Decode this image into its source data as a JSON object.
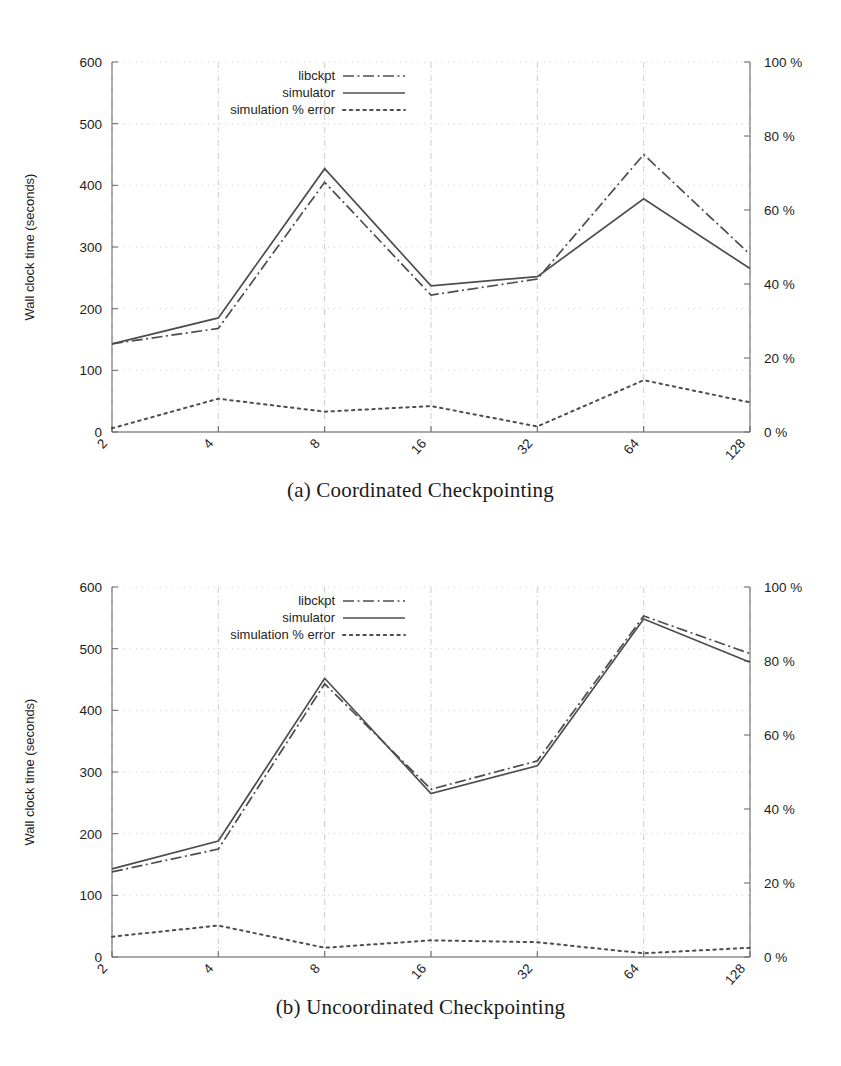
{
  "figures": [
    {
      "id": "a",
      "caption": "(a) Coordinated Checkpointing",
      "chart_data": {
        "type": "line",
        "title": "",
        "xlabel": "Nodes",
        "ylabel": "Wall clock time (seconds)",
        "y2label": "",
        "x": [
          2,
          4,
          8,
          16,
          32,
          64,
          128
        ],
        "categories": [
          "2",
          "4",
          "8",
          "16",
          "32",
          "64",
          "128"
        ],
        "ylim": [
          0,
          600
        ],
        "yticks": [
          0,
          100,
          200,
          300,
          400,
          500,
          600
        ],
        "ytick_labels": [
          "0",
          "100",
          "200",
          "300",
          "400",
          "500",
          "600"
        ],
        "y2lim": [
          0,
          100
        ],
        "y2ticks": [
          0,
          20,
          40,
          60,
          80,
          100
        ],
        "y2tick_labels": [
          "0 %",
          "20 %",
          "40 %",
          "60 %",
          "80 %",
          "100 %"
        ],
        "grid": true,
        "legend_position": "top-center",
        "series": [
          {
            "name": "libckpt",
            "style": "dash-dot",
            "axis": "left",
            "values": [
              143,
              168,
              405,
              222,
              248,
              450,
              288
            ]
          },
          {
            "name": "simulator",
            "style": "solid",
            "axis": "left",
            "values": [
              143,
              185,
              427,
              237,
              252,
              378,
              265
            ]
          },
          {
            "name": "simulation % error",
            "style": "dotted",
            "axis": "right",
            "values": [
              1,
              9,
              5.5,
              7,
              1.5,
              14,
              8
            ]
          }
        ]
      }
    },
    {
      "id": "b",
      "caption": "(b) Uncoordinated Checkpointing",
      "chart_data": {
        "type": "line",
        "title": "",
        "xlabel": "Nodes",
        "ylabel": "Wall clock time (seconds)",
        "y2label": "",
        "x": [
          2,
          4,
          8,
          16,
          32,
          64,
          128
        ],
        "categories": [
          "2",
          "4",
          "8",
          "16",
          "32",
          "64",
          "128"
        ],
        "ylim": [
          0,
          600
        ],
        "yticks": [
          0,
          100,
          200,
          300,
          400,
          500,
          600
        ],
        "ytick_labels": [
          "0",
          "100",
          "200",
          "300",
          "400",
          "500",
          "600"
        ],
        "y2lim": [
          0,
          100
        ],
        "y2ticks": [
          0,
          20,
          40,
          60,
          80,
          100
        ],
        "y2tick_labels": [
          "0 %",
          "20 %",
          "40 %",
          "60 %",
          "80 %",
          "100 %"
        ],
        "grid": true,
        "legend_position": "top-center",
        "series": [
          {
            "name": "libckpt",
            "style": "dash-dot",
            "axis": "left",
            "values": [
              138,
              175,
              443,
              272,
              318,
              553,
              492
            ]
          },
          {
            "name": "simulator",
            "style": "solid",
            "axis": "left",
            "values": [
              143,
              188,
              452,
              265,
              310,
              548,
              478
            ]
          },
          {
            "name": "simulation % error",
            "style": "dotted",
            "axis": "right",
            "values": [
              5.5,
              8.5,
              2.5,
              4.5,
              4,
              1,
              2.5
            ]
          }
        ]
      }
    }
  ],
  "colors": {
    "line": "#4d4d4d",
    "grid": "#c8c8c8",
    "axis": "#6f6f6f",
    "text": "#1d1d1d",
    "background": "#ffffff"
  }
}
